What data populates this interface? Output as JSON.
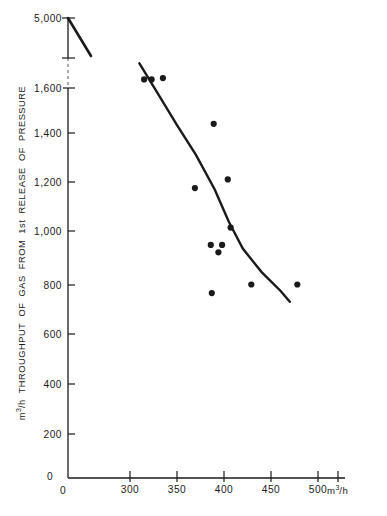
{
  "chart_data": {
    "type": "scatter",
    "title": "",
    "subtitle": "",
    "xlabel": "m³/h",
    "ylabel": "m³/h THROUGHPUT OF GAS FROM 1st RELEASE OF PRESSURE",
    "xlim": [
      0,
      510
    ],
    "ylim": [
      0,
      1700
    ],
    "grid": false,
    "legend": "none",
    "axis_break_note": "y-axis has a break between 1,600 and 5,000",
    "xticks": [
      {
        "value": 0,
        "label": "0"
      },
      {
        "value": 300,
        "label": "300"
      },
      {
        "value": 350,
        "label": "350"
      },
      {
        "value": 400,
        "label": "400"
      },
      {
        "value": 450,
        "label": "450"
      },
      {
        "value": 500,
        "label": "500"
      }
    ],
    "yticks": [
      {
        "value": 200,
        "label": "200"
      },
      {
        "value": 400,
        "label": "400"
      },
      {
        "value": 600,
        "label": "600"
      },
      {
        "value": 800,
        "label": "800"
      },
      {
        "value": 1000,
        "label": "1,000"
      },
      {
        "value": 1200,
        "label": "1,200"
      },
      {
        "value": 1400,
        "label": "1,400"
      },
      {
        "value": 1600,
        "label": "1,600"
      },
      {
        "value": 5000,
        "label": "5,000"
      }
    ],
    "y_origin_label": "0",
    "x_origin_label": "0",
    "series": [
      {
        "name": "observations",
        "marker": "filled-circle",
        "color": "#1a1a1a",
        "points": [
          {
            "x": 315,
            "y": 1635
          },
          {
            "x": 323,
            "y": 1635
          },
          {
            "x": 335,
            "y": 1640
          },
          {
            "x": 389,
            "y": 1455
          },
          {
            "x": 369,
            "y": 1195
          },
          {
            "x": 404,
            "y": 1230
          },
          {
            "x": 407,
            "y": 1035
          },
          {
            "x": 386,
            "y": 965
          },
          {
            "x": 398,
            "y": 965
          },
          {
            "x": 394,
            "y": 935
          },
          {
            "x": 429,
            "y": 805
          },
          {
            "x": 478,
            "y": 805
          },
          {
            "x": 387,
            "y": 770
          }
        ]
      }
    ],
    "fitted_curve": {
      "name": "fitted trend curve",
      "color": "#1a1a1a",
      "points": [
        {
          "x": 310,
          "y": 1700
        },
        {
          "x": 330,
          "y": 1575
        },
        {
          "x": 350,
          "y": 1450
        },
        {
          "x": 370,
          "y": 1330
        },
        {
          "x": 390,
          "y": 1190
        },
        {
          "x": 405,
          "y": 1060
        },
        {
          "x": 420,
          "y": 950
        },
        {
          "x": 440,
          "y": 855
        },
        {
          "x": 460,
          "y": 780
        },
        {
          "x": 470,
          "y": 735
        }
      ]
    },
    "upper_segment": {
      "name": "upper axis-break curve segment near 5,000",
      "color": "#1a1a1a",
      "points": [
        {
          "x_px": 68,
          "y_label": "5,000"
        },
        {
          "x_px": 91,
          "y_label": "below break tick"
        }
      ]
    }
  },
  "colors": {
    "ink": "#1a1a1a",
    "background": "#ffffff",
    "dashed_guide": "#555555"
  }
}
